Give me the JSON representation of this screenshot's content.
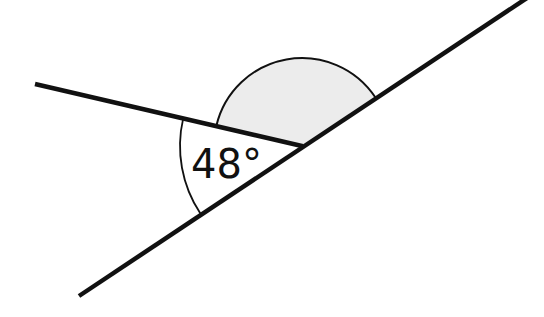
{
  "diagram": {
    "type": "angles-on-a-straight-line",
    "known_angle": {
      "label": "48°",
      "value_degrees": 48
    },
    "unknown_angle": {
      "shaded": true,
      "label": ""
    },
    "colors": {
      "stroke": "#111111",
      "shaded_fill": "#ececec",
      "background": "#ffffff"
    }
  }
}
